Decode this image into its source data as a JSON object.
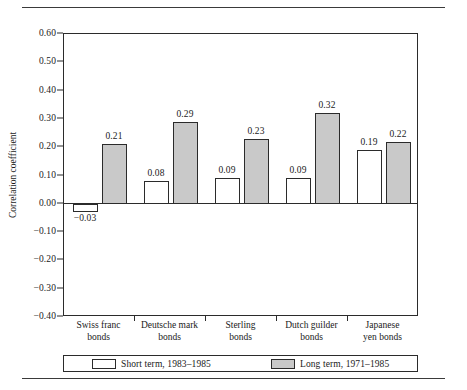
{
  "chart_data": {
    "type": "bar",
    "title": "",
    "xlabel": "",
    "ylabel": "Correlation coefficient",
    "ylim": [
      -0.4,
      0.6
    ],
    "ytick_labels": [
      "0.60",
      "0.50",
      "0.40",
      "0.30",
      "0.20",
      "0.10",
      "0.00",
      "−0.10",
      "−0.20",
      "−0.30",
      "−0.40"
    ],
    "ytick_values": [
      0.6,
      0.5,
      0.4,
      0.3,
      0.2,
      0.1,
      0.0,
      -0.1,
      -0.2,
      -0.3,
      -0.4
    ],
    "grid": false,
    "legend_position": "bottom",
    "categories": [
      "Swiss franc\nbonds",
      "Deutsche mark\nbonds",
      "Sterling\nbonds",
      "Dutch guilder\nbonds",
      "Japanese\nyen bonds"
    ],
    "category_lines": [
      [
        "Swiss franc",
        "bonds"
      ],
      [
        "Deutsche mark",
        "bonds"
      ],
      [
        "Sterling",
        "bonds"
      ],
      [
        "Dutch guilder",
        "bonds"
      ],
      [
        "Japanese",
        "yen bonds"
      ]
    ],
    "series": [
      {
        "name": "Short term, 1983–1985",
        "color": "#ffffff",
        "values": [
          -0.03,
          0.08,
          0.09,
          0.09,
          0.19
        ],
        "labels": [
          "−0.03",
          "0.08",
          "0.09",
          "0.09",
          "0.19"
        ]
      },
      {
        "name": "Long term, 1971–1985",
        "color": "#c9c9c9",
        "values": [
          0.21,
          0.29,
          0.23,
          0.32,
          0.22
        ],
        "labels": [
          "0.21",
          "0.29",
          "0.23",
          "0.32",
          "0.22"
        ]
      }
    ]
  },
  "legend": {
    "items": [
      {
        "label": "Short term, 1983–1985",
        "swatch": "short"
      },
      {
        "label": "Long term, 1971–1985",
        "swatch": "long"
      }
    ]
  },
  "colors": {
    "axis": "#2b2b2b",
    "short_term_fill": "#ffffff",
    "long_term_fill": "#c9c9c9",
    "background": "#ffffff"
  }
}
